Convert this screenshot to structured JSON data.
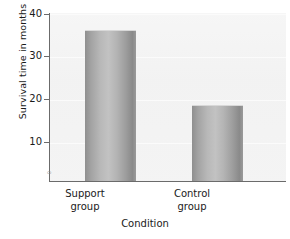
{
  "chart_data": {
    "type": "bar",
    "title": "",
    "xlabel": "Condition",
    "ylabel": "Survival time in months",
    "categories": [
      "Support group",
      "Control group"
    ],
    "values": [
      36,
      18
    ],
    "ylim": [
      0,
      40
    ],
    "yticks": [
      0,
      10,
      20,
      30,
      40
    ],
    "ytick_labels": [
      "0",
      "10",
      "20",
      "30",
      "40"
    ],
    "grid": true,
    "legend": "none",
    "bar_color": "#b0b0b0",
    "plot_background": "#f2f2f2",
    "axis_color": "#6b6b6b"
  },
  "axes": {
    "y_title": "Survival time in months",
    "x_title": "Condition",
    "ticks": [
      {
        "label": "40",
        "value": 40
      },
      {
        "label": "30",
        "value": 30
      },
      {
        "label": "20",
        "value": 20
      },
      {
        "label": "10",
        "value": 10
      }
    ],
    "zero_label": "0"
  },
  "categories": [
    {
      "line1": "Support",
      "line2": "group",
      "value": 36
    },
    {
      "line1": "Control",
      "line2": "group",
      "value": 18
    }
  ]
}
